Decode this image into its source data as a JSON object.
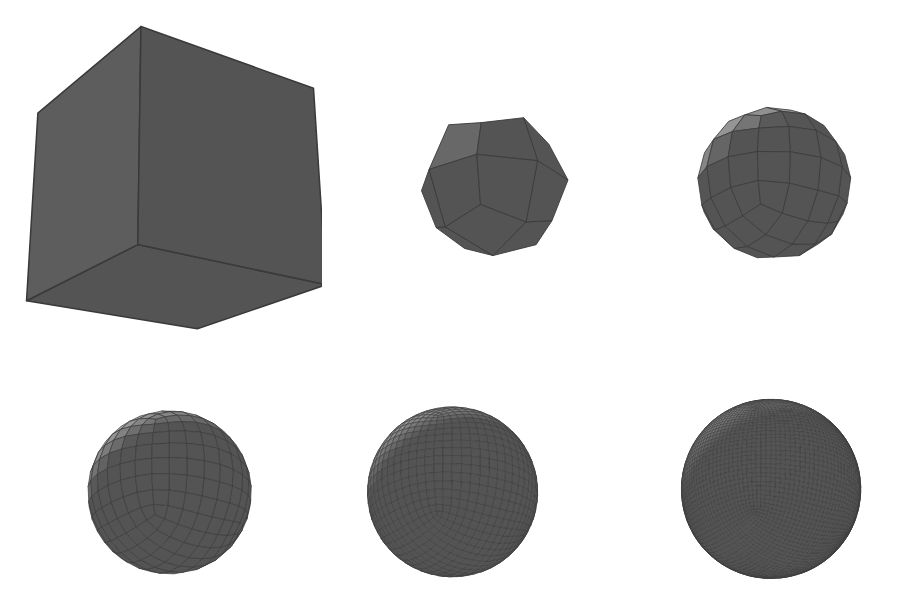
{
  "figure": {
    "background_color": "#ffffff",
    "width": 902,
    "height": 611,
    "edge_color": "#3a3a3a",
    "shading": {
      "light_direction": [
        -0.35,
        0.62,
        0.7
      ],
      "ambient": 0.34,
      "diffuse": 0.66,
      "base_gray_hex": "#e6e6e6",
      "darkest_gray_hex": "#4a4a4a",
      "noise": "film-grain speckle, low amplitude"
    },
    "camera": {
      "yaw_deg": -34,
      "pitch_deg": 22,
      "projection": "perspective",
      "description": "cube viewed from above-left-front, top face and two side faces visible"
    },
    "face_tones": {
      "top_face_hex": "#d9d9d9",
      "right_face_hex": "#c6c6c6",
      "front_left_face_hex": "#808080"
    }
  },
  "panels": [
    {
      "index": 0,
      "name": "subdivision-level-0",
      "label": "level 0",
      "subdivision_level": 0,
      "quad_faces": 6,
      "faces_per_original_face": 1,
      "smooth_shaded": false,
      "draw_edges": true,
      "edge_width": 1.3,
      "sphere_blend": 0.0,
      "box": {
        "x": 22,
        "y": 18,
        "w": 300,
        "h": 350
      },
      "scale": 0.93
    },
    {
      "index": 1,
      "name": "subdivision-level-1",
      "label": "level 1",
      "subdivision_level": 1,
      "quad_faces": 24,
      "faces_per_original_face": 4,
      "smooth_shaded": false,
      "draw_edges": true,
      "edge_width": 1.1,
      "sphere_blend": 0.3,
      "box": {
        "x": 388,
        "y": 68,
        "w": 210,
        "h": 235
      },
      "scale": 0.8
    },
    {
      "index": 2,
      "name": "subdivision-level-2",
      "label": "level 2",
      "subdivision_level": 2,
      "quad_faces": 96,
      "faces_per_original_face": 16,
      "smooth_shaded": false,
      "draw_edges": true,
      "edge_width": 1.0,
      "sphere_blend": 0.5,
      "box": {
        "x": 668,
        "y": 66,
        "w": 212,
        "h": 235
      },
      "scale": 0.8
    },
    {
      "index": 3,
      "name": "subdivision-level-3",
      "label": "level 3",
      "subdivision_level": 3,
      "quad_faces": 384,
      "faces_per_original_face": 64,
      "smooth_shaded": false,
      "draw_edges": true,
      "edge_width": 0.85,
      "sphere_blend": 0.62,
      "box": {
        "x": 62,
        "y": 380,
        "w": 215,
        "h": 225
      },
      "scale": 0.8
    },
    {
      "index": 4,
      "name": "subdivision-level-4",
      "label": "level 4",
      "subdivision_level": 4,
      "quad_faces": 1536,
      "faces_per_original_face": 256,
      "smooth_shaded": false,
      "draw_edges": true,
      "edge_width": 0.7,
      "sphere_blend": 0.7,
      "box": {
        "x": 345,
        "y": 378,
        "w": 215,
        "h": 228
      },
      "scale": 0.8
    },
    {
      "index": 5,
      "name": "subdivision-level-5",
      "label": "level 5",
      "subdivision_level": 5,
      "quad_faces": 6144,
      "faces_per_original_face": 1024,
      "smooth_shaded": false,
      "draw_edges": true,
      "edge_width": 0.6,
      "sphere_blend": 0.74,
      "box": {
        "x": 660,
        "y": 372,
        "w": 222,
        "h": 234
      },
      "scale": 0.8
    }
  ],
  "captions": {
    "show": false,
    "items": [
      "",
      "",
      "",
      "",
      "",
      ""
    ]
  }
}
